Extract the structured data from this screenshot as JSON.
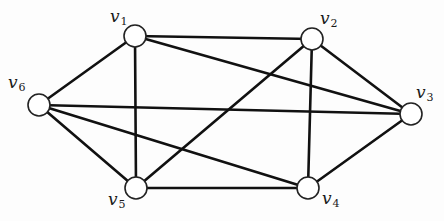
{
  "diagram": {
    "type": "graph",
    "directed": false,
    "colors": {
      "edge": "#111111",
      "node_fill": "#ffffff",
      "node_stroke": "#222222",
      "background": "#fdfdfd"
    },
    "nodes": [
      {
        "id": "v1",
        "base": "v",
        "sub": "1",
        "cx": 135,
        "cy": 36,
        "label_x": 110,
        "label_y": 8
      },
      {
        "id": "v2",
        "base": "v",
        "sub": "2",
        "cx": 312,
        "cy": 39,
        "label_x": 320,
        "label_y": 10
      },
      {
        "id": "v3",
        "base": "v",
        "sub": "3",
        "cx": 411,
        "cy": 114,
        "label_x": 416,
        "label_y": 84
      },
      {
        "id": "v4",
        "base": "v",
        "sub": "4",
        "cx": 308,
        "cy": 188,
        "label_x": 322,
        "label_y": 190
      },
      {
        "id": "v5",
        "base": "v",
        "sub": "5",
        "cx": 136,
        "cy": 188,
        "label_x": 108,
        "label_y": 191
      },
      {
        "id": "v6",
        "base": "v",
        "sub": "6",
        "cx": 39,
        "cy": 105,
        "label_x": 8,
        "label_y": 74
      }
    ],
    "edges": [
      [
        "v1",
        "v2"
      ],
      [
        "v1",
        "v3"
      ],
      [
        "v1",
        "v5"
      ],
      [
        "v1",
        "v6"
      ],
      [
        "v2",
        "v3"
      ],
      [
        "v2",
        "v4"
      ],
      [
        "v2",
        "v5"
      ],
      [
        "v3",
        "v4"
      ],
      [
        "v3",
        "v6"
      ],
      [
        "v4",
        "v5"
      ],
      [
        "v4",
        "v6"
      ],
      [
        "v5",
        "v6"
      ]
    ],
    "node_radius": 11
  }
}
